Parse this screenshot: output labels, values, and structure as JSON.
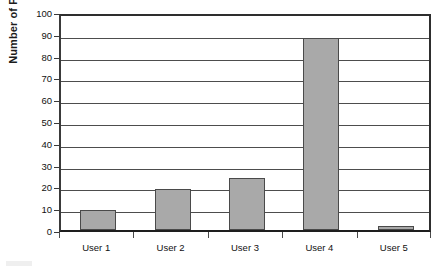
{
  "chart_data": {
    "type": "bar",
    "title": "",
    "subtitle": "",
    "xlabel": "",
    "ylabel": "Number of Posts",
    "categories": [
      "User 1",
      "User 2",
      "User 3",
      "User 4",
      "User 5"
    ],
    "values": [
      9,
      19,
      24,
      88,
      2
    ],
    "series": [
      {
        "name": "Number of Posts",
        "values": [
          9,
          19,
          24,
          88,
          2
        ]
      }
    ],
    "ylim": [
      0,
      100
    ],
    "ytick_step": 10,
    "yticks": [
      0,
      10,
      20,
      30,
      40,
      50,
      60,
      70,
      80,
      90,
      100
    ],
    "ytick_labels": [
      "0",
      "10",
      "20",
      "30",
      "40",
      "50",
      "60",
      "70",
      "80",
      "90",
      "100"
    ],
    "grid": true,
    "grid_axis": "y",
    "legend": false,
    "legend_position": "none",
    "bar_fill_color": "#a9a9a9",
    "bar_border_color": "#4a4a4a",
    "plot_border_color": "#2e2e2e",
    "gridline_color": "#4d4d4d",
    "background_color": "#ffffff",
    "text_color": "#111111",
    "annotations": []
  },
  "axes": {
    "y_title": "Number of Posts"
  }
}
